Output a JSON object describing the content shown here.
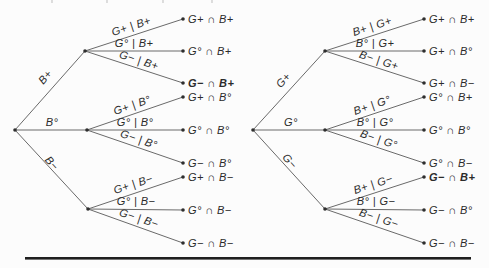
{
  "left_tree": {
    "root_branches": [
      "B+",
      "B°",
      "B−"
    ],
    "branch_labels": [
      "G+ | B+",
      "G° | B+",
      "G− | B+",
      "G+ | B°",
      "G° | B°",
      "G− | B°",
      "G+ | B−",
      "G° | B−",
      "G− | B−"
    ],
    "leaf_labels": [
      "G+ ∩ B+",
      "G° ∩ B+",
      "G− ∩ B+",
      "G+ ∩ B°",
      "G° ∩ B°",
      "G− ∩ B°",
      "G+ ∩ B−",
      "G° ∩ B−",
      "G− ∩ B−"
    ],
    "bold_leaf_index": 2
  },
  "right_tree": {
    "root_branches": [
      "G+",
      "G°",
      "G−"
    ],
    "branch_labels": [
      "B+ | G+",
      "B° | G+",
      "B− | G+",
      "B+ | G°",
      "B° | G°",
      "B− | G°",
      "B+ | G−",
      "B° | G−",
      "B− | G−"
    ],
    "leaf_labels": [
      "G+ ∩ B+",
      "G+ ∩ B°",
      "G+ ∩ B−",
      "G° ∩ B+",
      "G° ∩ B°",
      "G° ∩ B−",
      "G− ∩ B+",
      "G− ∩ B°",
      "G− ∩ B−"
    ],
    "bold_leaf_index": 6
  },
  "colors": {
    "edge": "#6a6a6a",
    "node": "#2e2e2e",
    "text": "#2b2b2b",
    "bottom_rule": "#1f1f1f"
  }
}
